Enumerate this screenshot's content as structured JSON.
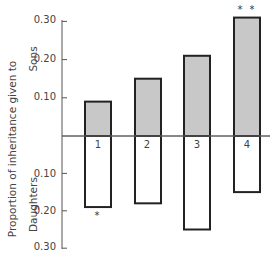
{
  "chart_data": {
    "type": "bar",
    "title": "",
    "xlabel": "",
    "ylabel": "Proportion of inheritance given to",
    "ylabel_upper": "Sons",
    "ylabel_lower": "Daughters",
    "categories": [
      "1",
      "2",
      "3",
      "4"
    ],
    "series": [
      {
        "name": "Sons",
        "direction": "up",
        "fill": "#c8c8c8",
        "values": [
          0.09,
          0.15,
          0.21,
          0.31
        ]
      },
      {
        "name": "Daughters",
        "direction": "down",
        "fill": "#ffffff",
        "values": [
          0.19,
          0.18,
          0.25,
          0.15
        ]
      }
    ],
    "significance": [
      "*",
      "",
      "",
      "* *"
    ],
    "significance_position": [
      "below-daughters",
      "",
      "",
      "above-sons"
    ],
    "upper_ticks": [
      "0.10",
      "0.20",
      "0.30"
    ],
    "lower_ticks": [
      "0.10",
      "0.20",
      "0.30"
    ],
    "ylim_upper": [
      0,
      0.3
    ],
    "ylim_lower": [
      0,
      0.3
    ],
    "grid": false,
    "legend": "none"
  }
}
